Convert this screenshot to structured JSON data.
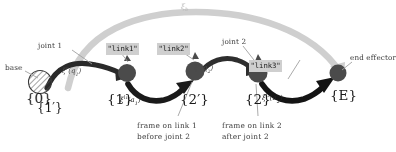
{
  "diagram": {
    "colors": {
      "ink": "#2b2b2b",
      "link_dark": "#262626",
      "joint_gray": "#4d4d4d",
      "arc_light": "#c9c9c9",
      "chip_bg": "#cfcfcf",
      "leader": "#9a9a9a",
      "paper": "#ffffff"
    },
    "annotations": {
      "base": "base",
      "joint1": "joint 1",
      "joint2": "joint 2",
      "end_effector": "end effector",
      "note_left_line1": "frame on link 1",
      "note_left_line2": "before joint 2",
      "note_right_line1": "frame on link 2",
      "note_right_line2": "after joint 2"
    },
    "link_names": {
      "link1": "\"link1\"",
      "link2": "\"link2\"",
      "link3": "\"link3\""
    },
    "frames": [
      {
        "id": "frame-0",
        "label": "{0}",
        "sublabel": "{1′}"
      },
      {
        "id": "frame-1",
        "label": "{1}",
        "sublabel": ""
      },
      {
        "id": "frame-2p",
        "label": "{2′}",
        "sublabel": ""
      },
      {
        "id": "frame-2",
        "label": "{2}",
        "sublabel": ""
      },
      {
        "id": "frame-E",
        "label": "{E}",
        "sublabel": ""
      }
    ],
    "transforms": {
      "joint1": {
        "symbol": "ξ",
        "sup": "r",
        "arg": "q",
        "argsub": "1"
      },
      "joint2": {
        "symbol": "ξ",
        "sup": "r",
        "arg": "q",
        "argsub": "2"
      },
      "link1": {
        "symbol": "ξ",
        "sup": "l",
        "supsub": "1",
        "arg": "a",
        "argsub": "1"
      },
      "link2": {
        "symbol": "ξ",
        "sup": "l",
        "supsub": "2",
        "arg": "a",
        "argsub": "2"
      },
      "overall": {
        "symbol": "ξ",
        "sub": "b"
      }
    }
  }
}
